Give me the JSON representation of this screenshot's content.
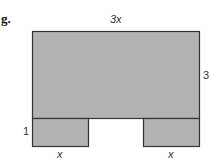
{
  "figure": {
    "part_label": "g.",
    "fill_color": "#b3b3b3",
    "stroke_color": "#333333",
    "labels": {
      "top_width": "3x",
      "right_height": "3",
      "left_leg_height": "1",
      "left_leg_width": "x",
      "right_leg_width": "x"
    },
    "shapes": [
      {
        "name": "main-rectangle",
        "width": "3x",
        "height": "3"
      },
      {
        "name": "left-leg-rectangle",
        "width": "x",
        "height": "1"
      },
      {
        "name": "right-leg-rectangle",
        "width": "x",
        "height": "1"
      }
    ]
  }
}
